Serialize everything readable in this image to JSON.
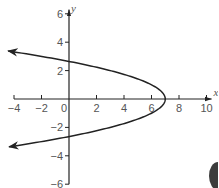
{
  "chart_data": {
    "type": "line",
    "title": "",
    "xlabel": "x",
    "ylabel": "y",
    "xlim": [
      -4,
      10
    ],
    "ylim": [
      -6,
      6
    ],
    "grid": false,
    "x_ticks": [
      -4,
      -2,
      0,
      2,
      4,
      6,
      8,
      10
    ],
    "x_tick_labels": [
      "-4",
      "-2",
      "0",
      "2",
      "4",
      "6",
      "8",
      "10"
    ],
    "y_ticks": [
      6,
      4,
      2,
      -2,
      -4,
      -6
    ],
    "y_tick_labels": [
      "6",
      "4",
      "2",
      "-2",
      "-4",
      "-6"
    ],
    "series": [
      {
        "name": "sideways parabola",
        "equation": "x = 7 - y^2",
        "vertex": [
          7,
          0
        ],
        "y_intercepts": [
          2.65,
          -2.65
        ],
        "arrows_at_ends": true,
        "points": [
          [
            -4.4,
            3.38
          ],
          [
            -3,
            3.16
          ],
          [
            -2,
            3.0
          ],
          [
            0,
            2.65
          ],
          [
            2,
            2.24
          ],
          [
            4,
            1.73
          ],
          [
            5,
            1.41
          ],
          [
            6,
            1.0
          ],
          [
            6.5,
            0.71
          ],
          [
            7,
            0
          ],
          [
            6.5,
            -0.71
          ],
          [
            6,
            -1.0
          ],
          [
            5,
            -1.41
          ],
          [
            4,
            -1.73
          ],
          [
            2,
            -2.24
          ],
          [
            0,
            -2.65
          ],
          [
            -2,
            -3.0
          ],
          [
            -3,
            -3.16
          ],
          [
            -4.4,
            -3.38
          ]
        ]
      }
    ]
  },
  "colors": {
    "axis": "#222222",
    "curve": "#222222",
    "labels": "#555555",
    "background": "#ffffff"
  }
}
